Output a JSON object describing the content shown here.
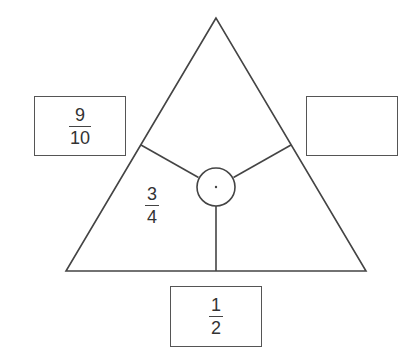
{
  "diagram": {
    "type": "fraction-triangle-puzzle",
    "stroke_color": "#444444",
    "background": "#ffffff",
    "triangle": {
      "apex": [
        216,
        18
      ],
      "base_left": [
        66,
        271
      ],
      "base_right": [
        366,
        271
      ]
    },
    "center_circle": {
      "cx": 216,
      "cy": 187,
      "r": 19,
      "has_center_dot": true
    },
    "inner_regions": {
      "left": {
        "fraction": {
          "numerator": "3",
          "denominator": "4"
        }
      },
      "right": {
        "fraction": null
      },
      "top": {
        "fraction": null
      }
    },
    "outer_boxes": {
      "left": {
        "fraction": {
          "numerator": "9",
          "denominator": "10"
        }
      },
      "right": {
        "fraction": null,
        "empty": true
      },
      "bottom": {
        "fraction": {
          "numerator": "1",
          "denominator": "2"
        }
      }
    }
  }
}
